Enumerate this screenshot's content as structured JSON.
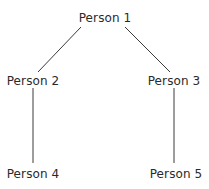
{
  "diagram": {
    "type": "tree",
    "line_color": "#3a3a3a",
    "text_color": "#2a2a2a",
    "nodes": [
      {
        "id": "p1",
        "label": "Person 1",
        "x": 105,
        "y": 11
      },
      {
        "id": "p2",
        "label": "Person 2",
        "x": 33,
        "y": 74
      },
      {
        "id": "p3",
        "label": "Person 3",
        "x": 174,
        "y": 74
      },
      {
        "id": "p4",
        "label": "Person 4",
        "x": 33,
        "y": 167
      },
      {
        "id": "p5",
        "label": "Person 5",
        "x": 176,
        "y": 167
      }
    ],
    "edges": [
      {
        "from": "p1",
        "to": "p2"
      },
      {
        "from": "p1",
        "to": "p3"
      },
      {
        "from": "p2",
        "to": "p4"
      },
      {
        "from": "p3",
        "to": "p5"
      }
    ]
  }
}
